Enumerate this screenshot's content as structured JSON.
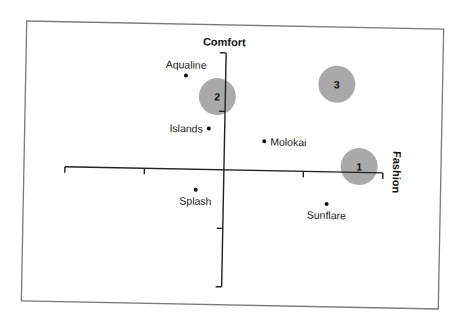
{
  "chart_data": {
    "type": "scatter",
    "subtype": "perceptual-map",
    "title": "",
    "xlabel": "Fashion",
    "ylabel": "Comfort",
    "xlim": [
      -2,
      2
    ],
    "ylim": [
      -2,
      2
    ],
    "x_ticks": [
      -2,
      -1,
      0,
      1,
      2
    ],
    "y_ticks": [
      -2,
      -1,
      0,
      1,
      2
    ],
    "tick_labels_shown": false,
    "grid": false,
    "legend": "none",
    "series": [
      {
        "name": "Brands",
        "marker": "dot",
        "points": [
          {
            "label": "Aqualine",
            "x": -0.5,
            "y": 1.6,
            "label_pos": "above"
          },
          {
            "label": "Islands",
            "x": -0.2,
            "y": 0.7,
            "label_pos": "left"
          },
          {
            "label": "Molokai",
            "x": 0.5,
            "y": 0.5,
            "label_pos": "right"
          },
          {
            "label": "Splash",
            "x": -0.35,
            "y": -0.35,
            "label_pos": "below"
          },
          {
            "label": "Sunflare",
            "x": 1.3,
            "y": -0.55,
            "label_pos": "below"
          }
        ]
      },
      {
        "name": "Segments (ideal points)",
        "marker": "circle",
        "points": [
          {
            "label": "1",
            "x": 1.7,
            "y": 0.1
          },
          {
            "label": "2",
            "x": -0.1,
            "y": 1.25
          },
          {
            "label": "3",
            "x": 1.4,
            "y": 1.5
          }
        ]
      }
    ]
  },
  "colors": {
    "axis": "#222222",
    "frame": "#7a7a7a",
    "segment_fill": "#a9a9a9",
    "dot": "#111111"
  }
}
